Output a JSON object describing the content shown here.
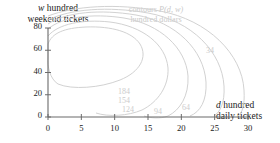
{
  "chart_data": {
    "type": "line",
    "subtype": "contour",
    "title": "",
    "annotation": {
      "line1_prefix": "contours ",
      "line1_var": "P(d, w)",
      "line2": "hundred dollars"
    },
    "xlabel_var": "d",
    "xlabel_text": " hundred",
    "xlabel_line2": "daily tickets",
    "ylabel_var": "w",
    "ylabel_text": " hundred",
    "ylabel_line2": "weekend tickets",
    "xlim": [
      0,
      30
    ],
    "ylim": [
      0,
      80
    ],
    "xticks": [
      "0",
      "5",
      "10",
      "15",
      "20",
      "25",
      "30"
    ],
    "yticks": [
      "80",
      "60",
      "40",
      "20",
      "0"
    ],
    "xtick_values": [
      0,
      5,
      10,
      15,
      20,
      25,
      30
    ],
    "ytick_values": [
      80,
      60,
      40,
      20,
      0
    ],
    "grid": false,
    "legend": "none",
    "contour_levels": [
      184,
      154,
      124,
      94,
      64,
      34
    ],
    "contour_step": 30,
    "contour_labels": [
      "184",
      "154",
      "124",
      "94",
      "64",
      "34"
    ],
    "contour_color": "#d2d2d2",
    "axis_color": "#6b6b6b",
    "label_color": "#cccccc",
    "contours": [
      {
        "level": "184",
        "label_x": 118,
        "label_y": 87,
        "path": "M 48 44 C 52 33, 64 28, 86 27 C 112 26, 132 32, 140 44 C 148 57, 140 72, 120 80 C 100 88, 72 90, 58 84 C 50 79, 47 66, 48 57 Z"
      },
      {
        "level": "154",
        "label_x": 118,
        "label_y": 96,
        "path": "M 48 36 C 58 24, 82 19, 110 22 C 142 26, 166 44, 168 68 C 169 86, 158 102, 142 110 C 128 116, 108 117, 96 113"
      },
      {
        "level": "124",
        "label_x": 122,
        "label_y": 105,
        "path": "M 48 29 C 62 17, 92 13, 124 18 C 160 24, 186 48, 188 76 C 189 96, 180 110, 168 116 C 160 119, 150 118, 144 116"
      },
      {
        "level": "94",
        "label_x": 154,
        "label_y": 107,
        "path": "M 48 24 C 66 12, 100 9, 136 15 C 176 22, 204 50, 206 82 C 207 101, 200 112, 190 116"
      },
      {
        "level": "64",
        "label_x": 182,
        "label_y": 103,
        "path": "M 48 20 C 70 9, 108 6, 148 13 C 192 21, 222 52, 224 86 C 225 103, 220 112, 214 116"
      },
      {
        "level": "34",
        "label_x": 206,
        "label_y": 46,
        "path": "M 48 16 C 74 6, 116 3, 160 11 C 208 20, 242 54, 244 90 C 245 106, 242 113, 238 116"
      }
    ]
  }
}
